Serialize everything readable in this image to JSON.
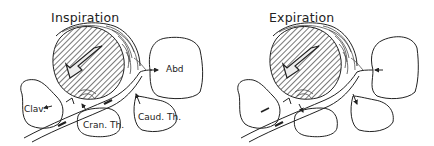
{
  "panels": [
    {
      "id": "inspiration",
      "title": "Inspiration",
      "labels": {
        "abd": "Abd",
        "clav": "Clav.",
        "cran_th": "Cran. Th.",
        "caud_th": "Caud. Th."
      }
    },
    {
      "id": "expiration",
      "title": "Expiration",
      "labels": {}
    }
  ],
  "colors": {
    "line": "#222222",
    "hatch": "#555555",
    "background": "#ffffff"
  }
}
